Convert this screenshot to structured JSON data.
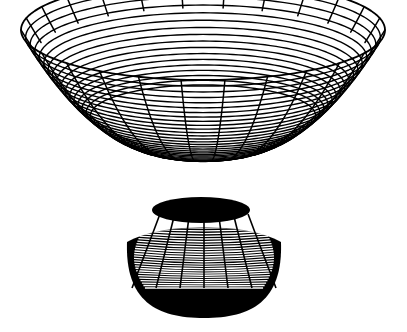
{
  "figure": {
    "width": 407,
    "height": 332,
    "background_color": "#ffffff",
    "line_color": "#000000",
    "fill_color": "#000000",
    "style": "line-art wireframe, black on white"
  },
  "chart_data": {
    "type": "line",
    "title": "",
    "subtitle": "",
    "xlabel": "",
    "ylabel": "",
    "zlabel": "",
    "render": "3d-wireframe-surface-of-revolution",
    "grid": true,
    "legend": false,
    "axes_visible": false,
    "tick_labels": [],
    "annotations": [],
    "surface": {
      "description": "Funnel / trumpet horn: radius decreases with depth, profile flares sharply near the top rim",
      "parametrization": "x = r(v)*cos(u), y = r(v)*sin(u), z = h(v)",
      "u_range": [
        0,
        6.283185
      ],
      "v_range": [
        0,
        1
      ],
      "u_divisions": 26,
      "v_divisions": 40,
      "radius_top": 1.0,
      "radius_bottom": 0.205,
      "profile_exponent": 3.1,
      "ring_compression": 2.55
    },
    "projection": {
      "type": "oblique-orthographic",
      "elevation_deg": 22,
      "azimuth_deg": 0,
      "center_x": 203,
      "center_y": 148,
      "scale_x": 182,
      "scale_y_depth": 50,
      "scale_z": 118
    },
    "extents_px": {
      "rim_top_center_y": 16,
      "rim_left_x": 21,
      "rim_left_y": 105,
      "rim_right_x": 385,
      "rim_right_y": 105,
      "rim_front_center_y": 175,
      "neck_top_y": 197,
      "neck_bottom_y": 237,
      "bulge_bottom_y": 317,
      "bulge_left_x": 128,
      "bulge_right_x": 282
    },
    "cavity_ellipse_px": {
      "center_x": 201,
      "center_y": 210,
      "radius_x": 49,
      "radius_y": 13,
      "fill": "#000000"
    },
    "bulge_ellipse_px": {
      "center_x": 204,
      "center_y": 250,
      "radius_x": 77,
      "radius_y": 68,
      "fill": "#000000"
    },
    "stroke_widths": {
      "radial_spoke": 1.5,
      "ring_upper": 1.4,
      "ring_lower": 1.1,
      "rim": 1.8
    }
  }
}
